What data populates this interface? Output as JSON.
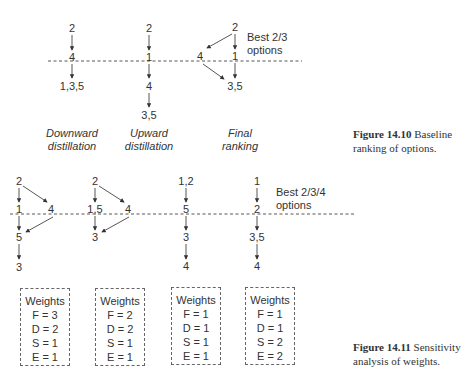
{
  "figure_1": {
    "nodes": {
      "c1_top": "2",
      "c1_mid": "4",
      "c1_bot": "1,3,5",
      "c2_top": "2",
      "c2_mid": "1",
      "c2_low": "4",
      "c2_bot": "3,5",
      "c3_top": "2",
      "c3_left": "4",
      "c3_mid": "1",
      "c3_bot": "3,5"
    },
    "best_label_line1": "Best 2/3",
    "best_label_line2": "options",
    "column_labels": [
      {
        "line1": "Downward",
        "line2": "distillation"
      },
      {
        "line1": "Upward",
        "line2": "distillation"
      },
      {
        "line1": "Final",
        "line2": "ranking"
      }
    ],
    "caption_bold": "Figure 14.10",
    "caption_line1": "Baseline",
    "caption_line2": "ranking of options."
  },
  "figure_2": {
    "nodes": {
      "a_top": "2",
      "a_mid": "1",
      "a_side": "4",
      "a_low": "5",
      "a_bot": "3",
      "b_top": "2",
      "b_mid": "1,5",
      "b_side": "4",
      "b_low": "3",
      "c_top": "1,2",
      "c_mid": "5",
      "c_low": "3",
      "c_bot": "4",
      "d_top": "1",
      "d_mid": "2",
      "d_low": "3,5",
      "d_bot": "4"
    },
    "best_label_line1": "Best 2/3/4",
    "best_label_line2": "options",
    "weights": [
      {
        "title": "Weights",
        "F": "F = 3",
        "D": "D = 2",
        "S": "S = 1",
        "E": "E = 1"
      },
      {
        "title": "Weights",
        "F": "F = 2",
        "D": "D = 2",
        "S": "S = 1",
        "E": "E = 1"
      },
      {
        "title": "Weights",
        "F": "F = 1",
        "D": "D = 1",
        "S": "S = 1",
        "E": "E = 1"
      },
      {
        "title": "Weights",
        "F": "F = 1",
        "D": "D = 1",
        "S": "S = 2",
        "E": "E = 2"
      }
    ],
    "caption_bold": "Figure 14.11",
    "caption_line1": "Sensitivity",
    "caption_line2": "analysis of weights."
  }
}
